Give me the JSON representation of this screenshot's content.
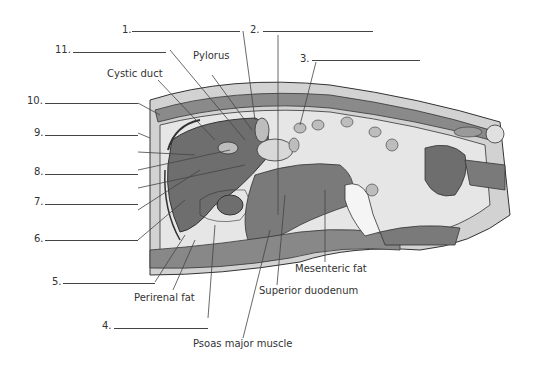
{
  "diagram": {
    "type": "anatomical cross-section (sagittal abdomen)",
    "colors": {
      "background": "#ffffff",
      "skin_fat": "#d2d2d2",
      "muscle": "#7a7a7a",
      "liver": "#6e6e6e",
      "fat_light": "#e6e6e6",
      "outline": "#333333",
      "leader_line": "#444444",
      "text": "#333333"
    },
    "numbered_blanks": [
      {
        "num": "1.",
        "answer": ""
      },
      {
        "num": "2.",
        "answer": ""
      },
      {
        "num": "3.",
        "answer": ""
      },
      {
        "num": "4.",
        "answer": ""
      },
      {
        "num": "5.",
        "answer": ""
      },
      {
        "num": "6.",
        "answer": ""
      },
      {
        "num": "7.",
        "answer": ""
      },
      {
        "num": "8.",
        "answer": ""
      },
      {
        "num": "9.",
        "answer": ""
      },
      {
        "num": "10.",
        "answer": ""
      },
      {
        "num": "11.",
        "answer": ""
      }
    ],
    "labels": {
      "pylorus": "Pylorus",
      "cystic_duct": "Cystic duct",
      "perirenal_fat": "Perirenal fat",
      "psoas_major": "Psoas major muscle",
      "superior_duodenum": "Superior duodenum",
      "mesenteric_fat": "Mesenteric fat"
    }
  }
}
